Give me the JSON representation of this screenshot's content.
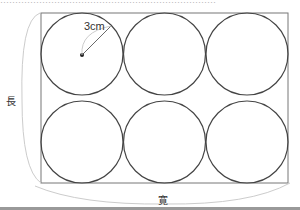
{
  "diagram": {
    "radius_label": "3cm",
    "length_label": "長",
    "width_label": "寛",
    "top_text": "………………………………………………………………",
    "layout": {
      "rows": 2,
      "cols": 3,
      "circle_radius_px": 41
    }
  }
}
